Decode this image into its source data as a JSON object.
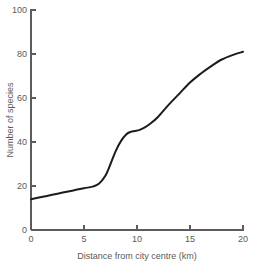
{
  "chart_data": {
    "type": "line",
    "title": "",
    "subtitle": "",
    "xlabel": "Distance from city centre (km)",
    "ylabel": "Number of species",
    "xlim": [
      0,
      20
    ],
    "ylim": [
      0,
      100
    ],
    "xticks": [
      0,
      5,
      10,
      15,
      20
    ],
    "yticks": [
      0,
      20,
      40,
      60,
      80,
      100
    ],
    "xtick_labels": [
      "0",
      "5",
      "10",
      "15",
      "20"
    ],
    "ytick_labels": [
      "0",
      "20",
      "40",
      "60",
      "80",
      "100"
    ],
    "grid": false,
    "legend": null,
    "legend_position": "none",
    "annotations": [],
    "series": [
      {
        "name": "Number of species",
        "color": "#1c1c1c",
        "x": [
          0.0,
          1.0,
          2.0,
          3.0,
          4.0,
          5.0,
          5.8,
          6.4,
          7.0,
          7.5,
          8.0,
          8.5,
          9.0,
          9.4,
          9.8,
          10.2,
          10.7,
          11.3,
          12.0,
          13.0,
          14.0,
          15.0,
          16.0,
          17.0,
          18.0,
          19.0,
          20.0
        ],
        "y": [
          14.0,
          15.0,
          16.0,
          17.0,
          18.0,
          19.0,
          19.7,
          21.0,
          24.5,
          30.0,
          36.0,
          40.5,
          43.5,
          44.6,
          45.0,
          45.4,
          46.5,
          48.5,
          51.5,
          57.0,
          62.0,
          67.0,
          71.0,
          74.5,
          77.5,
          79.5,
          81.0
        ]
      }
    ]
  },
  "axes": {
    "y_title": "Number of species",
    "x_title": "Distance from city centre (km)"
  }
}
